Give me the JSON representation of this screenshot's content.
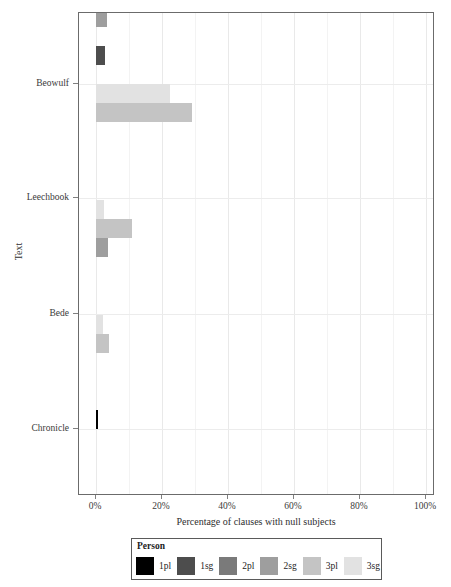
{
  "chart_data": {
    "type": "bar",
    "orientation": "horizontal",
    "grouped": true,
    "title": "",
    "xlabel": "Percentage of clauses with null subjects",
    "ylabel": "Text",
    "xlim": [
      0,
      100
    ],
    "xticks": [
      0,
      20,
      40,
      60,
      80,
      100
    ],
    "xtick_labels": [
      "0%",
      "20%",
      "40%",
      "60%",
      "80%",
      "100%"
    ],
    "categories": [
      "Beowulf",
      "Leechbook",
      "Bede",
      "Chronicle"
    ],
    "legend_title": "Person",
    "legend_position": "bottom",
    "grid": true,
    "series": [
      {
        "name": "1pl",
        "color": "#000000",
        "values": [
          0.0,
          0.0,
          0.0,
          0.6
        ]
      },
      {
        "name": "1sg",
        "color": "#4d4d4d",
        "values": [
          2.7,
          0.0,
          0.0,
          0.0
        ]
      },
      {
        "name": "2pl",
        "color": "#7a7a7a",
        "values": [
          0.0,
          0.0,
          0.0,
          0.0
        ]
      },
      {
        "name": "2sg",
        "color": "#9e9e9e",
        "values": [
          3.3,
          0.0,
          3.5,
          0.0
        ]
      },
      {
        "name": "3pl",
        "color": "#c4c4c4",
        "values": [
          29.0,
          29.0,
          11.0,
          4.0
        ]
      },
      {
        "name": "3sg",
        "color": "#e2e2e2",
        "values": [
          19.5,
          22.5,
          2.5,
          2.0
        ]
      }
    ]
  },
  "legend": {
    "title": "Person",
    "items": [
      {
        "label": "1pl",
        "color": "#000000"
      },
      {
        "label": "1sg",
        "color": "#4d4d4d"
      },
      {
        "label": "2pl",
        "color": "#7a7a7a"
      },
      {
        "label": "2sg",
        "color": "#9e9e9e"
      },
      {
        "label": "3pl",
        "color": "#c4c4c4"
      },
      {
        "label": "3sg",
        "color": "#e2e2e2"
      }
    ]
  },
  "axes": {
    "x_title": "Percentage of clauses with null subjects",
    "y_title": "Text",
    "x_tick_labels": [
      "0%",
      "20%",
      "40%",
      "60%",
      "80%",
      "100%"
    ],
    "y_tick_labels": [
      "Beowulf",
      "Leechbook",
      "Bede",
      "Chronicle"
    ]
  }
}
